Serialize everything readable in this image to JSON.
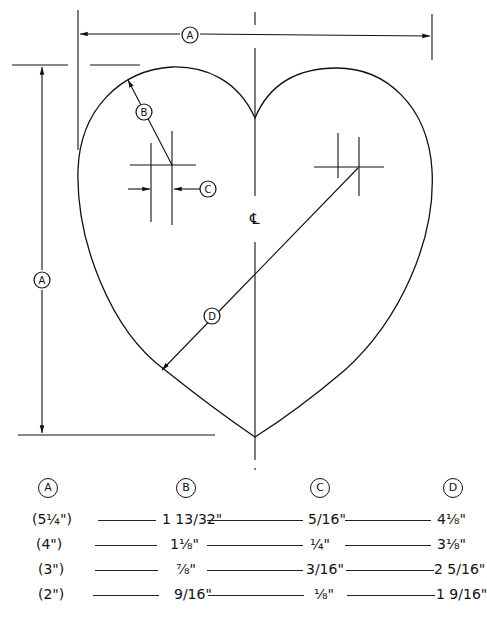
{
  "drawing": {
    "title": "Heart pattern layout",
    "labels": {
      "width_dimension": "A",
      "height_dimension": "A",
      "lobe_radius": "B",
      "center_offset": "C",
      "bottom_radius": "D",
      "centerline_symbol": "℄"
    }
  },
  "table": {
    "headers": [
      "A",
      "B",
      "C",
      "D"
    ],
    "rows": [
      {
        "a": "(5¼\")",
        "b": "1 13/32\"",
        "c": "5/16\"",
        "d": "4⅛\""
      },
      {
        "a": "(4\")",
        "b": "1⅛\"",
        "c": "¼\"",
        "d": "3⅛\""
      },
      {
        "a": "(3\")",
        "b": "⅞\"",
        "c": "3/16\"",
        "d": "2 5/16\""
      },
      {
        "a": "(2\")",
        "b": "9/16\"",
        "c": "⅛\"",
        "d": "1 9/16\""
      }
    ]
  }
}
